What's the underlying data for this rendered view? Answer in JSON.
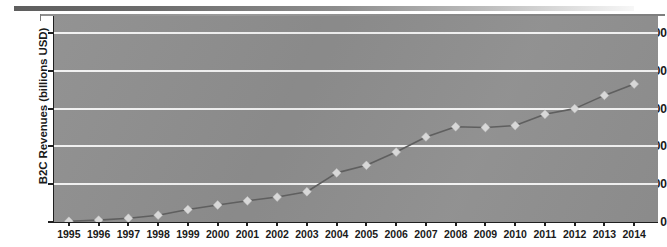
{
  "chart_data": {
    "type": "line",
    "title": "",
    "xlabel": "",
    "ylabel": "B2C Revenues (billions USD)",
    "x": [
      1995,
      1996,
      1997,
      1998,
      1999,
      2000,
      2001,
      2002,
      2003,
      2004,
      2005,
      2006,
      2007,
      2008,
      2009,
      2010,
      2011,
      2012,
      2013,
      2014
    ],
    "categories": [
      "1995",
      "1996",
      "1997",
      "1998",
      "1999",
      "2000",
      "2001",
      "2002",
      "2003",
      "2004",
      "2005",
      "2006",
      "2007",
      "2008",
      "2009",
      "2010",
      "2011",
      "2012",
      "2013",
      "2014"
    ],
    "values": [
      2,
      5,
      10,
      18,
      33,
      45,
      56,
      66,
      80,
      130,
      150,
      185,
      225,
      252,
      250,
      255,
      285,
      300,
      335,
      365
    ],
    "series": [
      {
        "name": "B2C Revenues",
        "marker": "diamond",
        "values": [
          2,
          5,
          10,
          18,
          33,
          45,
          56,
          66,
          80,
          130,
          150,
          185,
          225,
          252,
          250,
          255,
          285,
          300,
          335,
          365
        ]
      }
    ],
    "xlim": [
      1994.5,
      2014.8
    ],
    "ylim": [
      0,
      545
    ],
    "yticks": [
      0,
      100,
      200,
      300,
      400,
      500
    ],
    "ytick_labels": [
      "0",
      "100",
      "200",
      "300",
      "400",
      "500"
    ],
    "grid": "horizontal",
    "legend": "none",
    "plot_background": "#8e8e8e",
    "gridline_color": "#f2f2f2",
    "line_color": "#5f5f5f",
    "marker_color": "#d8d8d8",
    "axis_color": "#1f1f1f",
    "text_color": "#1a1a1a"
  },
  "figure": {
    "background": "#ffffff",
    "top_rule_left_color": "#5e5e5e",
    "top_rule_right_color": "#f7f7f7"
  }
}
